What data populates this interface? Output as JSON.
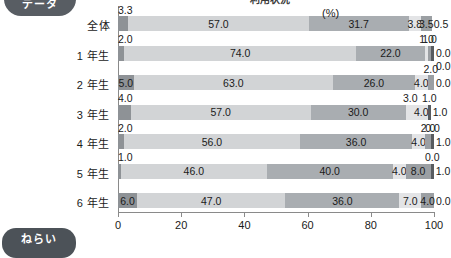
{
  "decor": {
    "badge_top_text": "データ",
    "badge_bottom_text": "ねらい",
    "title_clipped": "利用状況"
  },
  "chart_data": {
    "type": "bar",
    "orientation": "horizontal",
    "stacked": true,
    "title": "利用状況",
    "xlabel": "(%)",
    "ylabel": "",
    "xlim": [
      0,
      100
    ],
    "xticks": [
      0,
      20,
      40,
      60,
      80,
      100
    ],
    "xtick_labels": [
      "0",
      "20",
      "40",
      "60",
      "80",
      "100"
    ],
    "unit": "(%)",
    "grid": false,
    "legend_position": "none",
    "categories": [
      "全体",
      "1 年生",
      "2 年生",
      "3 年生",
      "4 年生",
      "5 年生",
      "6 年生"
    ],
    "series": [
      {
        "name": "seg1",
        "values": [
          3.3,
          2.0,
          5.0,
          4.0,
          2.0,
          1.0,
          6.0
        ]
      },
      {
        "name": "seg2",
        "values": [
          57.0,
          74.0,
          63.0,
          57.0,
          56.0,
          46.0,
          47.0
        ]
      },
      {
        "name": "seg3",
        "values": [
          31.7,
          22.0,
          26.0,
          30.0,
          36.0,
          40.0,
          36.0
        ]
      },
      {
        "name": "seg4",
        "values": [
          3.8,
          1.0,
          4.0,
          3.0,
          4.0,
          4.0,
          7.0
        ]
      },
      {
        "name": "seg5",
        "values": [
          3.5,
          1.0,
          2.0,
          4.0,
          2.0,
          8.0,
          4.0
        ]
      },
      {
        "name": "seg6",
        "values": [
          0.0,
          0.0,
          0.0,
          1.0,
          0.0,
          0.0,
          0.0
        ]
      },
      {
        "name": "seg7",
        "values": [
          0.5,
          0.0,
          0.0,
          1.0,
          1.0,
          1.0,
          0.0
        ]
      }
    ],
    "rows": [
      {
        "label": "全体",
        "segments": [
          {
            "value": "3.3",
            "pct": 3.3,
            "color": "c0",
            "label_pos": "above"
          },
          {
            "value": "57.0",
            "pct": 57.0,
            "color": "c1",
            "label_pos": "in"
          },
          {
            "value": "31.7",
            "pct": 31.7,
            "color": "c2",
            "label_pos": "in"
          },
          {
            "value": "3.8",
            "pct": 3.8,
            "color": "c3",
            "label_pos": "in"
          },
          {
            "value": "3.5",
            "pct": 3.5,
            "color": "c4",
            "label_pos": "in"
          },
          {
            "value": "0.5",
            "pct": 0.5,
            "color": "c6",
            "label_pos": "right"
          }
        ]
      },
      {
        "label": "1 年生",
        "segments": [
          {
            "value": "2.0",
            "pct": 2.0,
            "color": "c0",
            "label_pos": "above"
          },
          {
            "value": "74.0",
            "pct": 74.0,
            "color": "c1",
            "label_pos": "in"
          },
          {
            "value": "22.0",
            "pct": 22.0,
            "color": "c2",
            "label_pos": "in"
          },
          {
            "value": "1.0",
            "pct": 1.0,
            "color": "c3",
            "label_pos": "above-c"
          },
          {
            "value": "1.0",
            "pct": 1.0,
            "color": "c4",
            "label_pos": "above-c"
          },
          {
            "value": "0.0",
            "pct": 0.0,
            "color": "c5",
            "label_pos": "right"
          },
          {
            "value": "0.0",
            "pct": 0.0,
            "color": "c6",
            "label_pos": "below-right"
          }
        ]
      },
      {
        "label": "2 年生",
        "segments": [
          {
            "value": "5.0",
            "pct": 5.0,
            "color": "c0",
            "label_pos": "in"
          },
          {
            "value": "63.0",
            "pct": 63.0,
            "color": "c1",
            "label_pos": "in"
          },
          {
            "value": "26.0",
            "pct": 26.0,
            "color": "c2",
            "label_pos": "in"
          },
          {
            "value": "4.0",
            "pct": 4.0,
            "color": "c3",
            "label_pos": "in"
          },
          {
            "value": "2.0",
            "pct": 2.0,
            "color": "c4",
            "label_pos": "above-c"
          },
          {
            "value": "0.0",
            "pct": 0.0,
            "color": "c6",
            "label_pos": "right"
          }
        ]
      },
      {
        "label": "3 年生",
        "segments": [
          {
            "value": "4.0",
            "pct": 4.0,
            "color": "c0",
            "label_pos": "above"
          },
          {
            "value": "57.0",
            "pct": 57.0,
            "color": "c1",
            "label_pos": "in"
          },
          {
            "value": "30.0",
            "pct": 30.0,
            "color": "c2",
            "label_pos": "in"
          },
          {
            "value": "3.0",
            "pct": 3.0,
            "color": "c3",
            "label_pos": "above-c"
          },
          {
            "value": "4.0",
            "pct": 4.0,
            "color": "c3",
            "label_pos": "in"
          },
          {
            "value": "1.0",
            "pct": 1.0,
            "color": "c5",
            "label_pos": "above-c"
          },
          {
            "value": "1.0",
            "pct": 1.0,
            "color": "c6",
            "label_pos": "right"
          }
        ]
      },
      {
        "label": "4 年生",
        "segments": [
          {
            "value": "2.0",
            "pct": 2.0,
            "color": "c0",
            "label_pos": "above"
          },
          {
            "value": "56.0",
            "pct": 56.0,
            "color": "c1",
            "label_pos": "in"
          },
          {
            "value": "36.0",
            "pct": 36.0,
            "color": "c2",
            "label_pos": "in"
          },
          {
            "value": "4.0",
            "pct": 4.0,
            "color": "c3",
            "label_pos": "in"
          },
          {
            "value": "2.0",
            "pct": 2.0,
            "color": "c4",
            "label_pos": "above-c"
          },
          {
            "value": "0.0",
            "pct": 0.0,
            "color": "c5",
            "label_pos": "above-c"
          },
          {
            "value": "1.0",
            "pct": 1.0,
            "color": "c6",
            "label_pos": "right"
          }
        ]
      },
      {
        "label": "5 年生",
        "segments": [
          {
            "value": "1.0",
            "pct": 1.0,
            "color": "c0",
            "label_pos": "above"
          },
          {
            "value": "46.0",
            "pct": 46.0,
            "color": "c1",
            "label_pos": "in"
          },
          {
            "value": "40.0",
            "pct": 40.0,
            "color": "c2",
            "label_pos": "in"
          },
          {
            "value": "4.0",
            "pct": 4.0,
            "color": "c3",
            "label_pos": "in"
          },
          {
            "value": "8.0",
            "pct": 8.0,
            "color": "c4",
            "label_pos": "in"
          },
          {
            "value": "0.0",
            "pct": 0.0,
            "color": "c5",
            "label_pos": "above-c"
          },
          {
            "value": "1.0",
            "pct": 1.0,
            "color": "c6",
            "label_pos": "right"
          }
        ]
      },
      {
        "label": "6 年生",
        "segments": [
          {
            "value": "6.0",
            "pct": 6.0,
            "color": "c0",
            "label_pos": "in"
          },
          {
            "value": "47.0",
            "pct": 47.0,
            "color": "c1",
            "label_pos": "in"
          },
          {
            "value": "36.0",
            "pct": 36.0,
            "color": "c2",
            "label_pos": "in"
          },
          {
            "value": "7.0",
            "pct": 7.0,
            "color": "c3",
            "label_pos": "in"
          },
          {
            "value": "4.0",
            "pct": 4.0,
            "color": "c4",
            "label_pos": "in"
          },
          {
            "value": "0.0",
            "pct": 0.0,
            "color": "c6",
            "label_pos": "right"
          }
        ]
      }
    ]
  }
}
